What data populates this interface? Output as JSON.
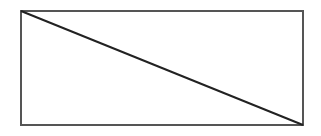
{
  "diagram": {
    "type": "rectangle-with-diagonal",
    "rectangle": {
      "x": 21,
      "y": 11,
      "width": 282,
      "height": 114,
      "stroke": "#555555",
      "stroke_width": 2,
      "fill": "#ffffff"
    },
    "diagonal": {
      "x1": 21,
      "y1": 11,
      "x2": 303,
      "y2": 125,
      "stroke": "#222222",
      "stroke_width": 2
    }
  }
}
